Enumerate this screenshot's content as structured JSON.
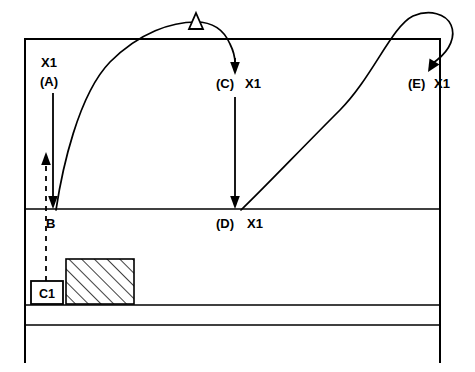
{
  "figure": {
    "background_color": "#ffffff",
    "line_color": "#000000"
  },
  "labels": {
    "a_signal": "X1",
    "a_ref": "(A)",
    "b_ref": "B",
    "c_ref": "(C)",
    "c_signal": "X1",
    "d_ref": "(D)",
    "d_signal": "X1",
    "e_ref": "(E)",
    "e_signal": "X1",
    "c1_box": "C1"
  },
  "markers": {
    "apex_marker": "hollow-triangle",
    "arrow_a": "down-arrow",
    "arrow_c": "down-arrow",
    "arrow_d": "down-arrow",
    "arrow_e": "diagonal-down-arrow",
    "arrow_c1": "dashed-up-arrow"
  },
  "geometry": {
    "frame_left": 25,
    "frame_right": 440,
    "frame_top": 39,
    "mid_line_y": 209,
    "lower_line_1_y": 305,
    "lower_line_2_y": 325,
    "frame_bottom": 362
  }
}
